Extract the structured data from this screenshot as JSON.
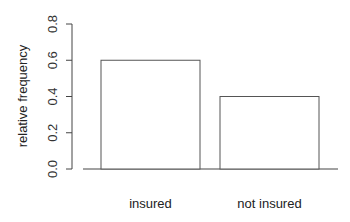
{
  "chart_data": {
    "type": "bar",
    "title": "",
    "xlabel": "",
    "ylabel": "relative frequency",
    "categories": [
      "insured",
      "not insured"
    ],
    "values": [
      0.6,
      0.4
    ],
    "ylim": [
      0,
      0.8
    ],
    "yticks": [
      "0.0",
      "0.2",
      "0.4",
      "0.6",
      "0.8"
    ],
    "grid": false,
    "legend": null
  },
  "colors": {
    "bar_fill": "#ffffff",
    "bar_stroke": "#555555",
    "axis": "#444444"
  }
}
